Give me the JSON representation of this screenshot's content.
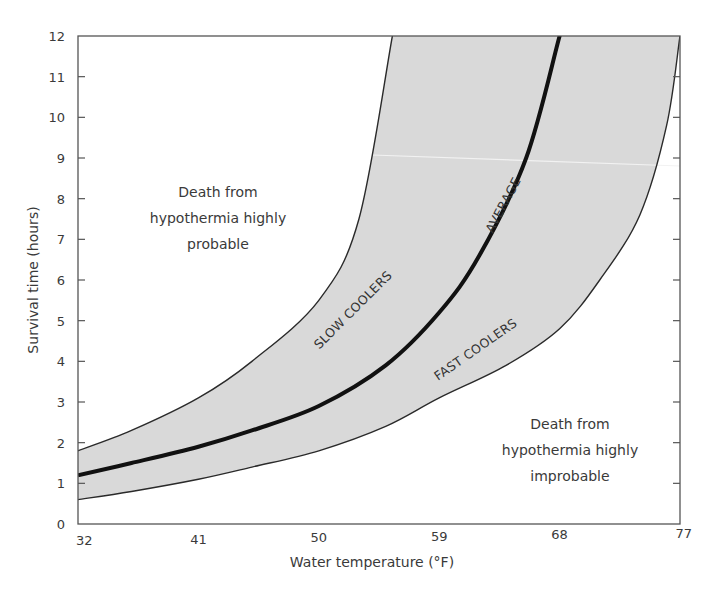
{
  "chart_data": {
    "type": "area",
    "title": "",
    "xlabel": "Water temperature (°F)",
    "ylabel": "Survival time (hours)",
    "xlim": [
      32,
      77
    ],
    "ylim": [
      0,
      12
    ],
    "x_ticks": [
      32,
      41,
      50,
      59,
      68,
      77
    ],
    "y_ticks": [
      0,
      1,
      2,
      3,
      4,
      5,
      6,
      7,
      8,
      9,
      10,
      11,
      12
    ],
    "grid": false,
    "legend": null,
    "series": [
      {
        "name": "SLOW COOLERS",
        "role": "upper band boundary",
        "points": [
          [
            32,
            1.8
          ],
          [
            36,
            2.3
          ],
          [
            41,
            3.1
          ],
          [
            45,
            4.0
          ],
          [
            50,
            5.5
          ],
          [
            53,
            7.5
          ],
          [
            55.5,
            12
          ]
        ]
      },
      {
        "name": "AVERAGE",
        "role": "center line (bold)",
        "points": [
          [
            32,
            1.2
          ],
          [
            36,
            1.5
          ],
          [
            41,
            1.9
          ],
          [
            45,
            2.3
          ],
          [
            50,
            2.9
          ],
          [
            55,
            3.9
          ],
          [
            59,
            5.2
          ],
          [
            62,
            6.6
          ],
          [
            65.5,
            9.0
          ],
          [
            68,
            12
          ]
        ]
      },
      {
        "name": "FAST COOLERS",
        "role": "lower band boundary",
        "points": [
          [
            32,
            0.6
          ],
          [
            36,
            0.8
          ],
          [
            41,
            1.1
          ],
          [
            45,
            1.4
          ],
          [
            50,
            1.8
          ],
          [
            55,
            2.4
          ],
          [
            59,
            3.1
          ],
          [
            64,
            3.9
          ],
          [
            68,
            4.8
          ],
          [
            71,
            6.0
          ],
          [
            74,
            7.6
          ],
          [
            76,
            9.8
          ],
          [
            77,
            12
          ]
        ]
      }
    ],
    "band_fill": "#d9d9d9",
    "annotations": [
      {
        "text": [
          "Death from",
          "hypothermia highly",
          "probable"
        ],
        "region": "upper-left"
      },
      {
        "text": [
          "Death from",
          "hypothermia highly",
          "improbable"
        ],
        "region": "lower-right"
      }
    ]
  },
  "labels": {
    "x_title": "Water temperature (°F)",
    "y_title": "Survival time (hours)",
    "slow": "SLOW COOLERS",
    "average": "AVERAGE",
    "fast": "FAST COOLERS",
    "probable": [
      "Death from",
      "hypothermia highly",
      "probable"
    ],
    "improbable": [
      "Death from",
      "hypothermia highly",
      "improbable"
    ]
  },
  "colors": {
    "band": "#d9d9d9",
    "line": "#1a1a1a",
    "frame": "#555555",
    "text": "#3a3a3a"
  }
}
